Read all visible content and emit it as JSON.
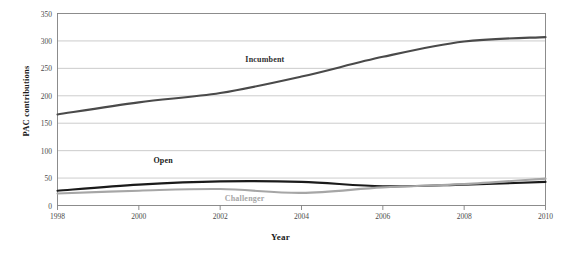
{
  "chart_data": {
    "type": "line",
    "title": "",
    "xlabel": "Year",
    "ylabel": "PAC contributions",
    "x": [
      1998,
      2000,
      2002,
      2004,
      2006,
      2008,
      2010
    ],
    "xticklabels": [
      "1998",
      "2000",
      "2002",
      "2004",
      "2006",
      "2008",
      "2010"
    ],
    "xlim": [
      1998,
      2010
    ],
    "ylim": [
      0,
      350
    ],
    "yticks": [
      0,
      50,
      100,
      150,
      200,
      250,
      300,
      350
    ],
    "yticklabels": [
      "0",
      "50",
      "100",
      "150",
      "200",
      "250",
      "300",
      "350"
    ],
    "grid": "horizontal",
    "legend": "inline-annotations",
    "series": [
      {
        "name": "Incumbent",
        "color": "#4a4a4a",
        "values": [
          166,
          188,
          205,
          235,
          271,
          299,
          307
        ],
        "label_x": 2003.1,
        "label_y": 268
      },
      {
        "name": "Open",
        "color": "#1a1a1a",
        "values": [
          27,
          38,
          44,
          43,
          35,
          38,
          43
        ],
        "label_x": 2000.6,
        "label_y": 83
      },
      {
        "name": "Challenger",
        "color": "#a6a6a6",
        "values": [
          22,
          27,
          30,
          23,
          33,
          39,
          49
        ],
        "label_x": 2002.6,
        "label_y": 13
      }
    ]
  },
  "axis": {
    "frame_color": "#808080",
    "grid_color": "#bfbfbf"
  }
}
